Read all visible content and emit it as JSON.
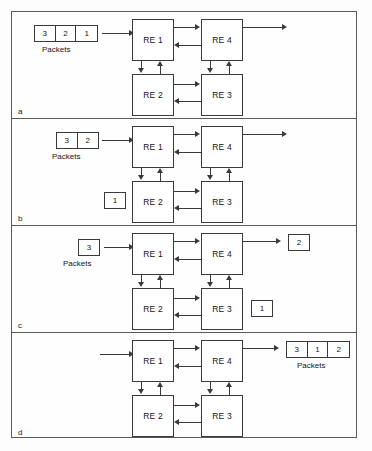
{
  "figure": {
    "type": "network-packet-reordering-diagram",
    "node_label_prefix": "RE",
    "packets_caption": "Packets",
    "nodes": [
      {
        "id": "re1",
        "label": "RE 1"
      },
      {
        "id": "re2",
        "label": "RE 2"
      },
      {
        "id": "re3",
        "label": "RE 3"
      },
      {
        "id": "re4",
        "label": "RE 4"
      }
    ],
    "links": [
      {
        "from": "RE 1",
        "to": "RE 4",
        "direction": "right"
      },
      {
        "from": "RE 4",
        "to": "RE 1",
        "direction": "left"
      },
      {
        "from": "RE 1",
        "to": "RE 2",
        "direction": "down"
      },
      {
        "from": "RE 2",
        "to": "RE 1",
        "direction": "up"
      },
      {
        "from": "RE 2",
        "to": "RE 3",
        "direction": "right"
      },
      {
        "from": "RE 3",
        "to": "RE 2",
        "direction": "left"
      },
      {
        "from": "RE 4",
        "to": "RE 3",
        "direction": "down"
      },
      {
        "from": "RE 3",
        "to": "RE 4",
        "direction": "up"
      }
    ],
    "panels": [
      {
        "id": "a",
        "label": "a",
        "input_packets": [
          "3",
          "2",
          "1"
        ],
        "input_caption": "Packets",
        "in_flight_packets": [],
        "output_packets": [],
        "output_caption": ""
      },
      {
        "id": "b",
        "label": "b",
        "input_packets": [
          "3",
          "2"
        ],
        "input_caption": "Packets",
        "in_flight_packets": [
          {
            "value": "1",
            "near_node": "RE 2"
          }
        ],
        "output_packets": [],
        "output_caption": ""
      },
      {
        "id": "c",
        "label": "c",
        "input_packets": [
          "3"
        ],
        "input_caption": "Packets",
        "in_flight_packets": [
          {
            "value": "1",
            "near_node": "RE 3"
          },
          {
            "value": "2",
            "near_node": "RE 4 output"
          }
        ],
        "output_packets": [],
        "output_caption": ""
      },
      {
        "id": "d",
        "label": "d",
        "input_packets": [],
        "input_caption": "",
        "in_flight_packets": [],
        "output_packets": [
          "3",
          "1",
          "2"
        ],
        "output_caption": "Packets"
      }
    ]
  },
  "colors": {
    "frame": "#5b5b5b",
    "line": "#3a3a3a",
    "text": "#141414",
    "background": "#fefefe"
  }
}
